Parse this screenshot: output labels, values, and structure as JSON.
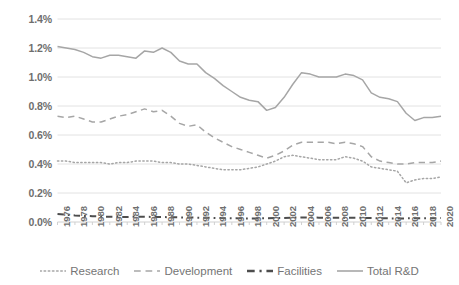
{
  "chart_data": {
    "type": "line",
    "title": "",
    "subtitle": "",
    "xlabel": "",
    "ylabel": "",
    "grid": true,
    "grid_axis": "y",
    "legend_position": "bottom",
    "xlim": [
      1976,
      2020
    ],
    "ylim": [
      0.0,
      1.4
    ],
    "y_tick_labels": [
      "1.4%",
      "1.2%",
      "1.0%",
      "0.8%",
      "0.6%",
      "0.4%",
      "0.2%",
      "0.0%"
    ],
    "y_tick_values": [
      1.4,
      1.2,
      1.0,
      0.8,
      0.6,
      0.4,
      0.2,
      0.0
    ],
    "x_tick_labels": [
      "1976",
      "1978",
      "1980",
      "1982",
      "1984",
      "1986",
      "1988",
      "1990",
      "1992",
      "1994",
      "1996",
      "1998",
      "2000",
      "2002",
      "2004",
      "2006",
      "2008",
      "2010",
      "2012",
      "2014",
      "2016",
      "2018",
      "2020"
    ],
    "x_tick_values": [
      1976,
      1978,
      1980,
      1982,
      1984,
      1986,
      1988,
      1990,
      1992,
      1994,
      1996,
      1998,
      2000,
      2002,
      2004,
      2006,
      2008,
      2010,
      2012,
      2014,
      2016,
      2018,
      2020
    ],
    "x": [
      1976,
      1977,
      1978,
      1979,
      1980,
      1981,
      1982,
      1983,
      1984,
      1985,
      1986,
      1987,
      1988,
      1989,
      1990,
      1991,
      1992,
      1993,
      1994,
      1995,
      1996,
      1997,
      1998,
      1999,
      2000,
      2001,
      2002,
      2003,
      2004,
      2005,
      2006,
      2007,
      2008,
      2009,
      2010,
      2011,
      2012,
      2013,
      2014,
      2015,
      2016,
      2017,
      2018,
      2019,
      2020
    ],
    "series": [
      {
        "name": "Research",
        "style": "dotted",
        "color": "#a6a6a6",
        "values": [
          0.42,
          0.42,
          0.41,
          0.41,
          0.41,
          0.41,
          0.4,
          0.41,
          0.41,
          0.42,
          0.42,
          0.42,
          0.41,
          0.41,
          0.4,
          0.4,
          0.39,
          0.38,
          0.37,
          0.36,
          0.36,
          0.36,
          0.37,
          0.38,
          0.4,
          0.42,
          0.45,
          0.46,
          0.45,
          0.44,
          0.43,
          0.43,
          0.43,
          0.45,
          0.44,
          0.42,
          0.38,
          0.37,
          0.36,
          0.35,
          0.27,
          0.29,
          0.3,
          0.3,
          0.31
        ]
      },
      {
        "name": "Development",
        "style": "dashed",
        "color": "#a6a6a6",
        "values": [
          0.73,
          0.72,
          0.73,
          0.71,
          0.69,
          0.69,
          0.71,
          0.73,
          0.74,
          0.76,
          0.78,
          0.76,
          0.77,
          0.73,
          0.68,
          0.66,
          0.67,
          0.62,
          0.58,
          0.55,
          0.52,
          0.5,
          0.48,
          0.46,
          0.44,
          0.46,
          0.49,
          0.53,
          0.55,
          0.55,
          0.55,
          0.55,
          0.54,
          0.55,
          0.54,
          0.52,
          0.45,
          0.42,
          0.41,
          0.4,
          0.4,
          0.41,
          0.41,
          0.41,
          0.42
        ]
      },
      {
        "name": "Facilities",
        "style": "dashdot",
        "color": "#4d4d4d",
        "values": [
          0.055,
          0.05,
          0.045,
          0.042,
          0.04,
          0.038,
          0.036,
          0.035,
          0.035,
          0.036,
          0.036,
          0.035,
          0.034,
          0.033,
          0.032,
          0.031,
          0.03,
          0.029,
          0.028,
          0.027,
          0.026,
          0.025,
          0.025,
          0.025,
          0.026,
          0.027,
          0.028,
          0.03,
          0.031,
          0.031,
          0.03,
          0.029,
          0.029,
          0.03,
          0.03,
          0.029,
          0.027,
          0.026,
          0.025,
          0.025,
          0.025,
          0.026,
          0.026,
          0.026,
          0.027
        ]
      },
      {
        "name": "Total R&D",
        "style": "solid",
        "color": "#a6a6a6",
        "values": [
          1.21,
          1.2,
          1.19,
          1.17,
          1.14,
          1.13,
          1.15,
          1.15,
          1.14,
          1.13,
          1.18,
          1.17,
          1.2,
          1.17,
          1.11,
          1.09,
          1.09,
          1.03,
          0.99,
          0.94,
          0.9,
          0.86,
          0.84,
          0.83,
          0.77,
          0.79,
          0.86,
          0.95,
          1.03,
          1.02,
          1.0,
          1.0,
          1.0,
          1.02,
          1.01,
          0.98,
          0.89,
          0.86,
          0.85,
          0.83,
          0.75,
          0.7,
          0.72,
          0.72,
          0.73
        ]
      }
    ]
  },
  "legend": {
    "items": [
      {
        "label": "Research",
        "icon": "dotted-line-swatch"
      },
      {
        "label": "Development",
        "icon": "dashed-line-swatch"
      },
      {
        "label": "Facilities",
        "icon": "dashdot-line-swatch"
      },
      {
        "label": "Total R&D",
        "icon": "solid-line-swatch"
      }
    ]
  },
  "colors": {
    "light_gray_line": "#a6a6a6",
    "dark_gray_line": "#4d4d4d",
    "gridline": "#e2e2e2",
    "axis_line": "#d0d0d0",
    "tick_text": "#6e6e6e",
    "legend_text": "#757575",
    "background": "#ffffff"
  }
}
